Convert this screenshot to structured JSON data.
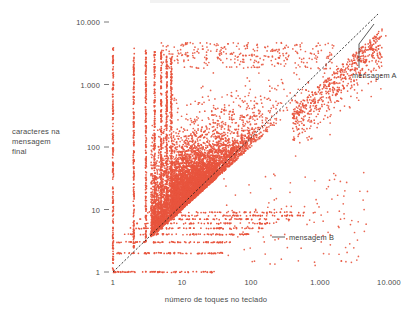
{
  "chart_data": {
    "type": "scatter",
    "title": "",
    "xlabel": "número de toques no teclado",
    "ylabel": "caracteres na mensagem final",
    "ylabel_lines": [
      "caracteres na",
      "mensagem",
      "final"
    ],
    "xscale": "log",
    "yscale": "log",
    "xlim": [
      1,
      20000
    ],
    "ylim": [
      1,
      20000
    ],
    "grid": false,
    "legend": "none",
    "point_color": "#e8553e",
    "xticks": [
      1,
      10,
      100,
      1000,
      10000
    ],
    "xtick_labels": [
      "1",
      "10",
      "100",
      "1.000",
      "10.000"
    ],
    "yticks": [
      1,
      10,
      100,
      1000,
      10000
    ],
    "ytick_labels": [
      "1",
      "10",
      "100",
      "1.000",
      "10.000"
    ],
    "reference_line": {
      "kind": "identity",
      "style": "dashed",
      "color": "#1a1a1a",
      "from": [
        1,
        1
      ],
      "to": [
        20000,
        20000
      ]
    },
    "annotations": [
      {
        "id": "mensagem-a",
        "label": "mensagem A",
        "target_x": 9000,
        "target_y": 6000,
        "label_x": 7500,
        "label_y": 1400
      },
      {
        "id": "mensagem-b",
        "label": "mensagem B",
        "target_x": 330,
        "target_y": 3.4,
        "label_x": 1100,
        "label_y": 3.4
      }
    ],
    "series": [
      {
        "name": "mensagens",
        "n_points_rendered": 4200,
        "point_size_px": 1.7,
        "color": "#e8553e"
      }
    ]
  },
  "axes": {
    "x_tick_labels": [
      "1",
      "10",
      "100",
      "1.000",
      "10.000"
    ],
    "y_tick_labels": [
      "1",
      "10",
      "100",
      "1.000",
      "10.000"
    ],
    "x_title": "número de toques no teclado",
    "y_title_line1": "caracteres na",
    "y_title_line2": "mensagem",
    "y_title_line3": "final"
  },
  "annotations": {
    "a_label": "mensagem A",
    "b_label": "mensagem B"
  }
}
